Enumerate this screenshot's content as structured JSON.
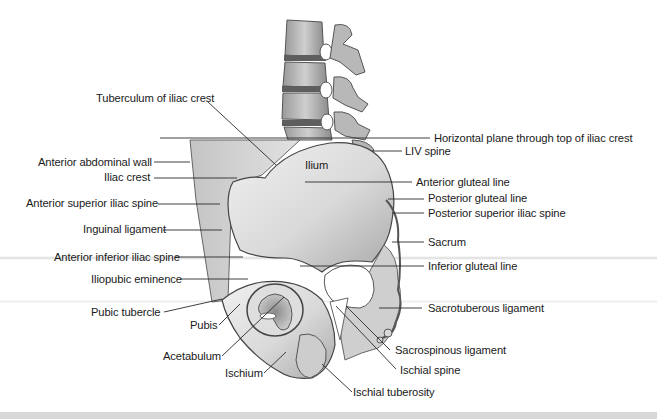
{
  "figure": {
    "region_label": "Ilium",
    "colors": {
      "background": "#ffffff",
      "bone_fill": "#e4e4e4",
      "bone_shade": "#b5b5b5",
      "bone_dark": "#7a7a7a",
      "outline": "#4a4a4a",
      "leader_line": "#2a2a2a",
      "text": "#1a1a1a",
      "bottom_band": "#d8d8d8"
    }
  },
  "labels_left": [
    {
      "id": "tuberculum",
      "text": "Tuberculum of iliac crest"
    },
    {
      "id": "anterior-abdominal-wall",
      "text": "Anterior abdominal wall"
    },
    {
      "id": "iliac-crest",
      "text": "Iliac crest"
    },
    {
      "id": "asis",
      "text": "Anterior superior iliac spine"
    },
    {
      "id": "inguinal-ligament",
      "text": "Inguinal ligament"
    },
    {
      "id": "aiis",
      "text": "Anterior inferior iliac spine"
    },
    {
      "id": "iliopubic-eminence",
      "text": "Iliopubic eminence"
    },
    {
      "id": "pubic-tubercle",
      "text": "Pubic tubercle"
    },
    {
      "id": "pubis",
      "text": "Pubis"
    },
    {
      "id": "acetabulum",
      "text": "Acetabulum"
    },
    {
      "id": "ischium",
      "text": "Ischium"
    }
  ],
  "labels_right": [
    {
      "id": "horizontal-plane",
      "text": "Horizontal plane through top of iliac crest"
    },
    {
      "id": "liv-spine",
      "text": "LIV spine"
    },
    {
      "id": "anterior-gluteal-line",
      "text": "Anterior gluteal line"
    },
    {
      "id": "posterior-gluteal-line",
      "text": "Posterior gluteal line"
    },
    {
      "id": "psis",
      "text": "Posterior superior iliac spine"
    },
    {
      "id": "sacrum",
      "text": "Sacrum"
    },
    {
      "id": "inferior-gluteal-line",
      "text": "Inferior gluteal line"
    },
    {
      "id": "sacrotuberous-ligament",
      "text": "Sacrotuberous ligament"
    },
    {
      "id": "sacrospinous-ligament",
      "text": "Sacrospinous ligament"
    },
    {
      "id": "ischial-spine",
      "text": "Ischial spine"
    },
    {
      "id": "ischial-tuberosity",
      "text": "Ischial tuberosity"
    }
  ]
}
